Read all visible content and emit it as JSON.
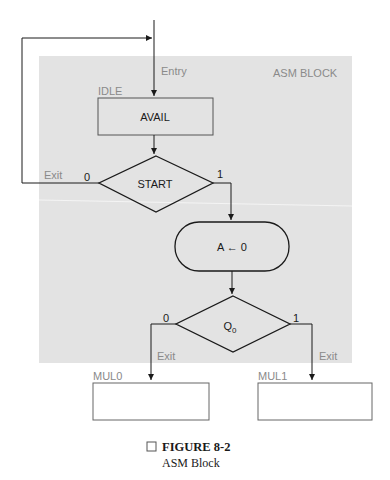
{
  "colors": {
    "block_fill": "#e3e3e3",
    "line": "#1a1a1a",
    "label_gray": "#8a8a8a",
    "text": "#1a1a1a"
  },
  "diagram": {
    "block_label": "ASM BLOCK",
    "entry_label": "Entry",
    "state_name": "IDLE",
    "state_box_text": "AVAIL",
    "decision1": {
      "text": "START",
      "false_label": "0",
      "true_label": "1",
      "exit_label": "Exit"
    },
    "conditional_output": {
      "text": "A ← 0"
    },
    "decision2": {
      "text": "Q",
      "subscript": "0",
      "false_label": "0",
      "true_label": "1"
    },
    "exit_left_label": "Exit",
    "exit_right_label": "Exit",
    "next_states": [
      {
        "name": "MUL0"
      },
      {
        "name": "MUL1"
      }
    ]
  },
  "caption": {
    "title": "FIGURE 8-2",
    "subtitle": "ASM Block"
  }
}
